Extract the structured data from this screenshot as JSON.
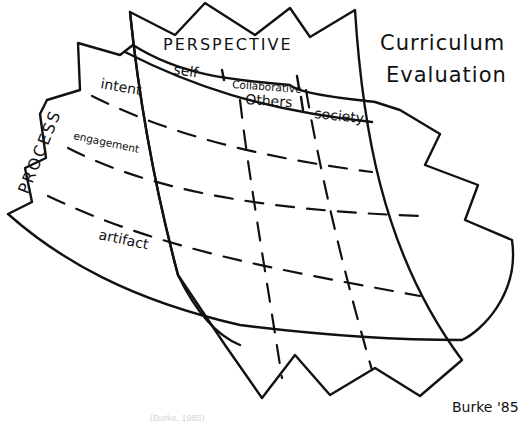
{
  "diagram": {
    "title_line1": "Curriculum",
    "title_line2": "Evaluation",
    "perspective": {
      "heading": "PERSPECTIVE",
      "columns": [
        "self",
        "Collaborative",
        "Others",
        "society"
      ]
    },
    "process": {
      "heading": "PROCESS",
      "rows": [
        "intent",
        "engagement",
        "artifact"
      ]
    },
    "signature": "Burke '85",
    "caption": "(Burke, 1985)",
    "ink_color": "#111111",
    "background": "#ffffff"
  }
}
